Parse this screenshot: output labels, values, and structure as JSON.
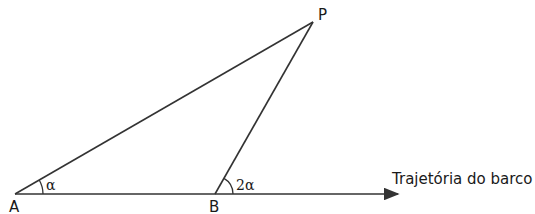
{
  "diagram": {
    "points": {
      "A": {
        "label": "A",
        "x": 15,
        "y": 194
      },
      "B": {
        "label": "B",
        "x": 215,
        "y": 194
      },
      "P": {
        "label": "P",
        "x": 313,
        "y": 22
      }
    },
    "angles": {
      "at_A": "α",
      "at_B": "2α"
    },
    "trajectory_label": "Trajetória do barco",
    "line_color": "#333333"
  }
}
